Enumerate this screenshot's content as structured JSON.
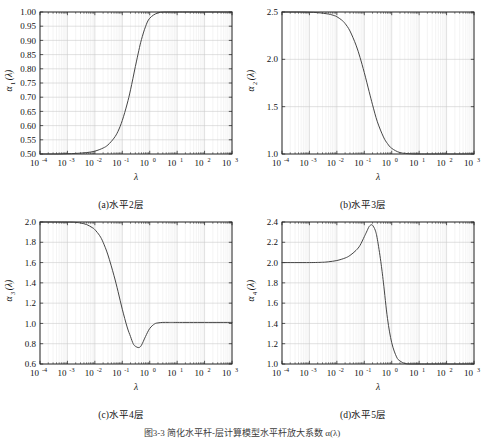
{
  "figure": {
    "caption": "图3-3  简化水平杆-层计算模型水平杆放大系数 α(λ)",
    "background": "#ffffff",
    "curve_color": "#3c3c3c",
    "grid_color": "#c8c8c8",
    "minor_grid_color": "#e2e2e2",
    "axis_color": "#1a1a1a"
  },
  "xaxis": {
    "label": "λ",
    "ticks": [
      "-4",
      "-3",
      "-2",
      "-1",
      "0",
      "1",
      "2",
      "3"
    ],
    "base": "10",
    "min_exp": -4,
    "max_exp": 3
  },
  "panels": [
    {
      "key": "a",
      "caption": "(a)水平2层",
      "ylabel_base": "α",
      "ylabel_sub": "1",
      "ylabel_arg": "(λ)",
      "yticks": [
        "0.50",
        "0.55",
        "0.60",
        "0.65",
        "0.70",
        "0.75",
        "0.80",
        "0.85",
        "0.90",
        "0.95",
        "1.00"
      ],
      "ymin": 0.5,
      "ymax": 1.0
    },
    {
      "key": "b",
      "caption": "(b)水平3层",
      "ylabel_base": "α",
      "ylabel_sub": "2",
      "ylabel_arg": "(λ)",
      "yticks": [
        "1.0",
        "1.5",
        "2.0",
        "2.5"
      ],
      "ymin": 1.0,
      "ymax": 2.5
    },
    {
      "key": "c",
      "caption": "(c)水平4层",
      "ylabel_base": "α",
      "ylabel_sub": "3",
      "ylabel_arg": "(λ)",
      "yticks": [
        "0.6",
        "0.8",
        "1.0",
        "1.2",
        "1.4",
        "1.6",
        "1.8",
        "2.0"
      ],
      "ymin": 0.6,
      "ymax": 2.0
    },
    {
      "key": "d",
      "caption": "(d)水平5层",
      "ylabel_base": "α",
      "ylabel_sub": "4",
      "ylabel_arg": "(λ)",
      "yticks": [
        "1.0",
        "1.2",
        "1.4",
        "1.6",
        "1.8",
        "2.0",
        "2.2",
        "2.4"
      ],
      "ymin": 1.0,
      "ymax": 2.4
    }
  ],
  "chart_data": [
    {
      "type": "line",
      "title": "(a)水平2层",
      "xlabel": "λ",
      "ylabel": "α1(λ)",
      "xscale": "log",
      "xlim": [
        0.0001,
        1000
      ],
      "ylim": [
        0.5,
        1.0
      ],
      "grid": true,
      "xticks": [
        0.0001,
        0.001,
        0.01,
        0.1,
        1,
        10,
        100,
        1000
      ],
      "xticklabels": [
        "10^-4",
        "10^-3",
        "10^-2",
        "10^-1",
        "10^0",
        "10^1",
        "10^2",
        "10^3"
      ],
      "yticks": [
        0.5,
        0.55,
        0.6,
        0.65,
        0.7,
        0.75,
        0.8,
        0.85,
        0.9,
        0.95,
        1.0
      ],
      "series": [
        {
          "name": "alpha1",
          "x": [
            0.0001,
            0.0002,
            0.0005,
            0.001,
            0.002,
            0.005,
            0.01,
            0.02,
            0.03,
            0.05,
            0.07,
            0.1,
            0.15,
            0.2,
            0.3,
            0.4,
            0.5,
            0.7,
            1,
            2,
            5,
            10,
            100,
            1000
          ],
          "y": [
            0.5,
            0.5,
            0.5,
            0.501,
            0.502,
            0.505,
            0.51,
            0.521,
            0.532,
            0.556,
            0.58,
            0.618,
            0.676,
            0.726,
            0.808,
            0.864,
            0.903,
            0.948,
            0.978,
            0.997,
            1.0,
            1.0,
            1.0,
            1.0
          ]
        }
      ]
    },
    {
      "type": "line",
      "title": "(b)水平3层",
      "xlabel": "λ",
      "ylabel": "α2(λ)",
      "xscale": "log",
      "xlim": [
        0.0001,
        1000
      ],
      "ylim": [
        1.0,
        2.5
      ],
      "grid": true,
      "xticks": [
        0.0001,
        0.001,
        0.01,
        0.1,
        1,
        10,
        100,
        1000
      ],
      "xticklabels": [
        "10^-4",
        "10^-3",
        "10^-2",
        "10^-1",
        "10^0",
        "10^1",
        "10^2",
        "10^3"
      ],
      "yticks": [
        1.0,
        1.5,
        2.0,
        2.5
      ],
      "series": [
        {
          "name": "alpha2",
          "x": [
            0.0001,
            0.0005,
            0.001,
            0.002,
            0.005,
            0.008,
            0.01,
            0.015,
            0.02,
            0.03,
            0.05,
            0.07,
            0.1,
            0.15,
            0.2,
            0.3,
            0.5,
            0.7,
            1,
            2,
            5,
            10,
            100,
            1000
          ],
          "y": [
            2.5,
            2.499,
            2.497,
            2.493,
            2.478,
            2.462,
            2.45,
            2.415,
            2.378,
            2.3,
            2.15,
            2.02,
            1.86,
            1.66,
            1.52,
            1.34,
            1.18,
            1.11,
            1.06,
            1.015,
            1.002,
            1.0,
            1.0,
            1.0
          ]
        }
      ]
    },
    {
      "type": "line",
      "title": "(c)水平4层",
      "xlabel": "λ",
      "ylabel": "α3(λ)",
      "xscale": "log",
      "xlim": [
        0.0001,
        1000
      ],
      "ylim": [
        0.6,
        2.0
      ],
      "grid": true,
      "xticks": [
        0.0001,
        0.001,
        0.01,
        0.1,
        1,
        10,
        100,
        1000
      ],
      "xticklabels": [
        "10^-4",
        "10^-3",
        "10^-2",
        "10^-1",
        "10^0",
        "10^1",
        "10^2",
        "10^3"
      ],
      "yticks": [
        0.6,
        0.8,
        1.0,
        1.2,
        1.4,
        1.6,
        1.8,
        2.0
      ],
      "series": [
        {
          "name": "alpha3",
          "x": [
            0.0001,
            0.001,
            0.002,
            0.003,
            0.005,
            0.008,
            0.01,
            0.015,
            0.02,
            0.03,
            0.05,
            0.07,
            0.1,
            0.15,
            0.2,
            0.25,
            0.3,
            0.4,
            0.5,
            0.7,
            1,
            1.5,
            2,
            3,
            5,
            10,
            100,
            1000
          ],
          "y": [
            2.0,
            1.999,
            1.996,
            1.99,
            1.975,
            1.945,
            1.925,
            1.865,
            1.8,
            1.675,
            1.47,
            1.315,
            1.14,
            0.965,
            0.87,
            0.8,
            0.775,
            0.762,
            0.785,
            0.87,
            0.95,
            0.995,
            1.005,
            1.01,
            1.01,
            1.01,
            1.01,
            1.01
          ]
        }
      ]
    },
    {
      "type": "line",
      "title": "(d)水平5层",
      "xlabel": "λ",
      "ylabel": "α4(λ)",
      "xscale": "log",
      "xlim": [
        0.0001,
        1000
      ],
      "ylim": [
        1.0,
        2.4
      ],
      "grid": true,
      "xticks": [
        0.0001,
        0.001,
        0.01,
        0.1,
        1,
        10,
        100,
        1000
      ],
      "xticklabels": [
        "10^-4",
        "10^-3",
        "10^-2",
        "10^-1",
        "10^0",
        "10^1",
        "10^2",
        "10^3"
      ],
      "yticks": [
        1.0,
        1.2,
        1.4,
        1.6,
        1.8,
        2.0,
        2.2,
        2.4
      ],
      "series": [
        {
          "name": "alpha4",
          "x": [
            0.0001,
            0.001,
            0.003,
            0.005,
            0.01,
            0.02,
            0.03,
            0.05,
            0.07,
            0.1,
            0.12,
            0.15,
            0.18,
            0.2,
            0.25,
            0.3,
            0.4,
            0.5,
            0.7,
            1,
            1.5,
            2,
            3,
            5,
            10,
            100,
            1000
          ],
          "y": [
            2.0,
            2.0,
            2.003,
            2.008,
            2.02,
            2.045,
            2.07,
            2.12,
            2.17,
            2.255,
            2.3,
            2.355,
            2.372,
            2.368,
            2.32,
            2.23,
            2.01,
            1.8,
            1.45,
            1.21,
            1.07,
            1.03,
            1.005,
            1.0,
            1.0,
            1.0,
            1.0
          ]
        }
      ]
    }
  ]
}
